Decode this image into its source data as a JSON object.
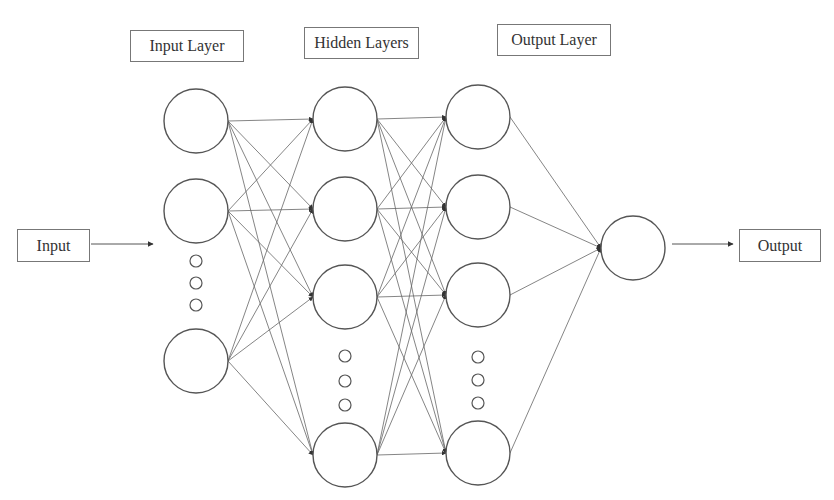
{
  "title_labels": {
    "input_layer": "Input Layer",
    "hidden_layers": "Hidden Layers",
    "output_layer": "Output Layer"
  },
  "io_labels": {
    "input": "Input",
    "output": "Output"
  },
  "colors": {
    "stroke": "#555555",
    "edge": "#666666",
    "background": "#ffffff"
  },
  "layers": [
    {
      "name": "input",
      "x": 196,
      "nodes": [
        121,
        211,
        361
      ],
      "ellipsis": [
        261,
        283,
        305
      ]
    },
    {
      "name": "hidden1",
      "x": 345,
      "nodes": [
        119,
        209,
        297,
        455
      ],
      "ellipsis": [
        356,
        381,
        405
      ]
    },
    {
      "name": "hidden2",
      "x": 478,
      "nodes": [
        117,
        207,
        295,
        453
      ],
      "ellipsis": [
        357,
        380,
        403
      ]
    },
    {
      "name": "output",
      "x": 633,
      "nodes": [
        248
      ],
      "ellipsis": []
    }
  ],
  "node_radius": 32
}
